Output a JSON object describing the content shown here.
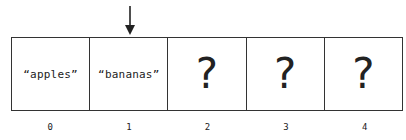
{
  "diagram": {
    "pointer": {
      "icon": "down-arrow-icon",
      "target_index": 1
    },
    "cells": [
      {
        "index": "0",
        "value": "“apples”",
        "kind": "string"
      },
      {
        "index": "1",
        "value": "“bananas”",
        "kind": "string"
      },
      {
        "index": "2",
        "value": "?",
        "kind": "unknown"
      },
      {
        "index": "3",
        "value": "?",
        "kind": "unknown"
      },
      {
        "index": "4",
        "value": "?",
        "kind": "unknown"
      }
    ]
  }
}
